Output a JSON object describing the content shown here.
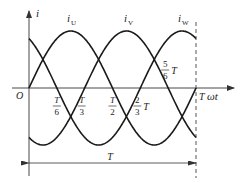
{
  "diagram": {
    "type": "three-phase-current-waveform",
    "axes": {
      "y_label": "i",
      "x_label": "ωt",
      "origin_label": "O"
    },
    "series": [
      {
        "name": "iU",
        "label_base": "i",
        "label_sub": "U",
        "phase_deg": 0
      },
      {
        "name": "iV",
        "label_base": "i",
        "label_sub": "V",
        "phase_deg": -120
      },
      {
        "name": "iW",
        "label_base": "i",
        "label_sub": "W",
        "phase_deg": 120
      }
    ],
    "period_fraction_range": [
      0,
      1
    ],
    "tick_labels": [
      {
        "id": "t1_6",
        "num": "T",
        "den": "6",
        "suffix": "",
        "t": 0.1667
      },
      {
        "id": "t1_3",
        "num": "T",
        "den": "3",
        "suffix": "",
        "t": 0.3333
      },
      {
        "id": "t1_2",
        "num": "T",
        "den": "2",
        "suffix": "",
        "t": 0.5
      },
      {
        "id": "t2_3",
        "num": "2",
        "den": "3",
        "suffix": "T",
        "t": 0.6667
      },
      {
        "id": "t5_6",
        "num": "5",
        "den": "6",
        "suffix": "T",
        "t": 0.8333
      }
    ],
    "end_label": "T",
    "period_dimension_label": "T"
  }
}
